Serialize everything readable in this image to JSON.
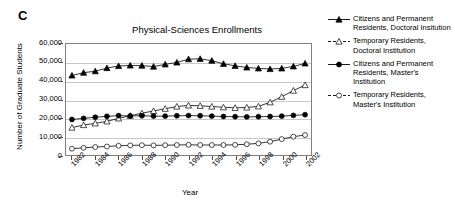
{
  "panel": {
    "label": "C"
  },
  "axis": {
    "ylabel": "Number of Graduate Students",
    "xlabel": "Year",
    "yticks": [
      "60,000",
      "50,000",
      "40,000",
      "30,000",
      "20,000",
      "10,000",
      "0"
    ],
    "xticks": [
      "1982",
      "1984",
      "1986",
      "1988",
      "1990",
      "1992",
      "1994",
      "1996",
      "1998",
      "2000",
      "2002"
    ]
  },
  "legend": {
    "entries": [
      {
        "label": "Citizens and Permanent Residents, Doctoral Insitution",
        "marker": "filled-triangle-icon",
        "line": "solid",
        "color": "#000000"
      },
      {
        "label": "Temporary Residents, Doctoral Institution",
        "marker": "open-triangle-icon",
        "line": "dashed",
        "color": "#000000"
      },
      {
        "label": "Citizens and Permanent Residents, Master's Institution",
        "marker": "filled-circle-icon",
        "line": "solid",
        "color": "#000000"
      },
      {
        "label": "Temporary Residents, Master's Institution",
        "marker": "open-circle-icon",
        "line": "dashed",
        "color": "#000000"
      }
    ]
  },
  "chart_data": {
    "type": "line",
    "title": "Physical-Sciences Enrollments",
    "xlabel": "Year",
    "ylabel": "Number of Graduate Students",
    "ylim": [
      0,
      60000
    ],
    "ytick_step": 10000,
    "grid": "horizontal",
    "legend_position": "right",
    "x": [
      1982,
      1983,
      1984,
      1985,
      1986,
      1987,
      1988,
      1989,
      1990,
      1991,
      1992,
      1993,
      1994,
      1995,
      1996,
      1997,
      1998,
      1999,
      2000,
      2001,
      2002
    ],
    "series": [
      {
        "name": "Citizens and Permanent Residents, Doctoral Insitution",
        "marker": "filled-triangle",
        "line": "solid",
        "values": [
          43000,
          44500,
          45300,
          47000,
          48100,
          48400,
          48300,
          47800,
          49000,
          50000,
          51800,
          52000,
          51000,
          49300,
          48200,
          47300,
          46800,
          46500,
          46800,
          47900,
          49500
        ]
      },
      {
        "name": "Temporary Residents, Doctoral Institution",
        "marker": "open-triangle",
        "line": "dashed",
        "values": [
          14800,
          16200,
          17100,
          18200,
          19800,
          21200,
          22600,
          23800,
          25000,
          26200,
          26800,
          26600,
          26200,
          25800,
          25500,
          25700,
          26300,
          28500,
          31500,
          34800,
          37800
        ]
      },
      {
        "name": "Citizens and Permanent Residents, Master's Institution",
        "marker": "filled-circle",
        "line": "solid",
        "values": [
          19200,
          19800,
          20400,
          20900,
          21300,
          21100,
          21200,
          21000,
          21000,
          21200,
          21300,
          21200,
          21000,
          20800,
          20700,
          20600,
          20700,
          20800,
          21000,
          21400,
          21800
        ]
      },
      {
        "name": "Temporary Residents, Master's Institution",
        "marker": "open-circle",
        "line": "dashed",
        "values": [
          3400,
          3900,
          4300,
          4600,
          5000,
          5200,
          5300,
          5200,
          5300,
          5400,
          5500,
          5400,
          5400,
          5400,
          5500,
          5800,
          6300,
          7200,
          8600,
          9900,
          10800
        ]
      }
    ]
  }
}
